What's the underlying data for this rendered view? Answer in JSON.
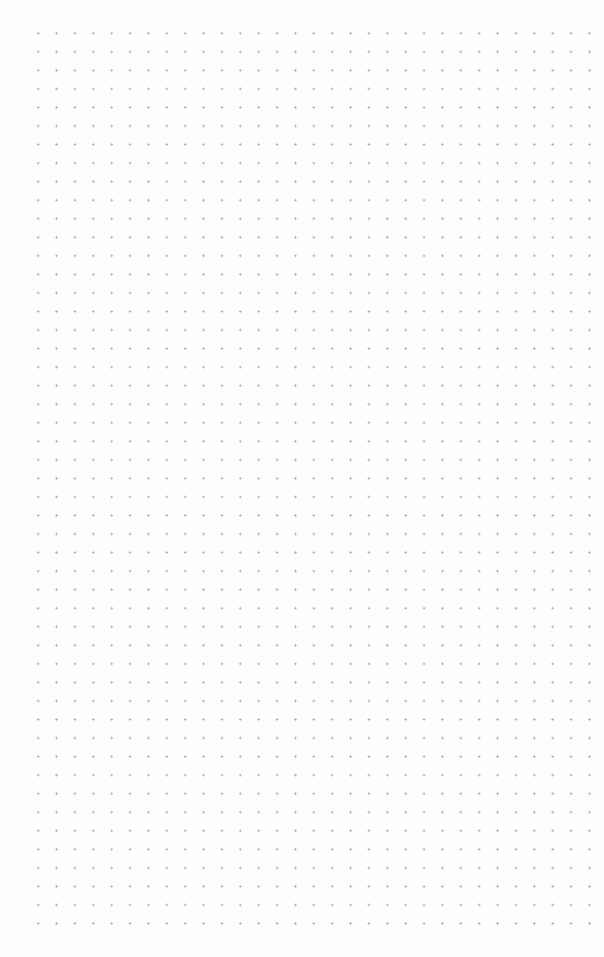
{
  "page": {
    "type": "dot-grid-paper",
    "background_color": "#fdfdfd",
    "dot_color": "#a9a9a9",
    "columns": 31,
    "rows": 49,
    "spacing_x": 18.38,
    "spacing_y": 18.55
  }
}
